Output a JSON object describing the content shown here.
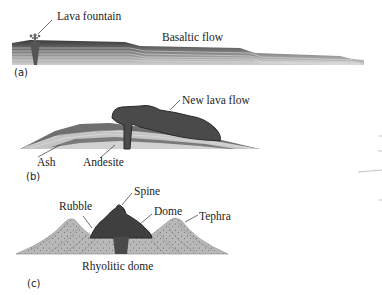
{
  "panels": {
    "a": {
      "tag": "(a)",
      "labels": {
        "lava_fountain": "Lava fountain",
        "basaltic_flow": "Basaltic flow"
      }
    },
    "b": {
      "tag": "(b)",
      "labels": {
        "new_lava_flow": "New lava flow",
        "ash": "Ash",
        "andesite": "Andesite"
      }
    },
    "c": {
      "tag": "(c)",
      "labels": {
        "spine": "Spine",
        "rubble": "Rubble",
        "dome": "Dome",
        "tephra": "Tephra"
      },
      "caption": "Rhyolitic dome"
    }
  },
  "colors": {
    "basalt_dark": "#3a3a3a",
    "layer_mid": "#8a8a8a",
    "layer_light": "#c8c8c8",
    "ash": "#bdbdbd",
    "andesite": "#6f6f6f",
    "lava_flow": "#4a4a4a",
    "dome": "#3f3f3f",
    "tephra": "#b4b4b4"
  }
}
